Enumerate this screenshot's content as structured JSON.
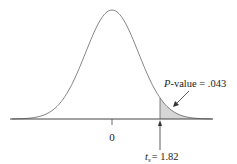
{
  "chart_data": {
    "type": "area",
    "title": "",
    "xlabel": "",
    "ylabel": "",
    "x_ticks": [
      "0"
    ],
    "center_label": "0",
    "test_statistic": {
      "symbol": "t",
      "subscript": "s",
      "value": 1.82,
      "label": "= 1.82"
    },
    "shaded_region": {
      "from": 1.82,
      "to": "inf",
      "tail": "upper"
    },
    "p_value": {
      "prefix": "P",
      "label": "-value = .043",
      "value": 0.043
    },
    "grid": false,
    "colors": {
      "curve": "#555555",
      "shade": "#d4d4d4",
      "axis": "#444444"
    }
  }
}
